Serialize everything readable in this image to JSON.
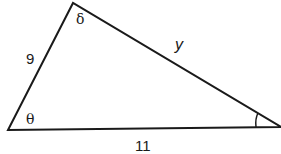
{
  "diagram": {
    "type": "triangle",
    "vertices": {
      "left": {
        "x": 8,
        "y": 130,
        "angle_label": "θ"
      },
      "top": {
        "x": 73,
        "y": 3,
        "angle_label": "δ"
      },
      "right": {
        "x": 281,
        "y": 127,
        "angle_label": "",
        "angle_marked": true
      }
    },
    "sides": {
      "left_top": {
        "label": "9"
      },
      "top_right": {
        "label": "y"
      },
      "left_right": {
        "label": "11"
      }
    },
    "colors": {
      "stroke": "#1a1a1a",
      "background": "#ffffff"
    }
  }
}
